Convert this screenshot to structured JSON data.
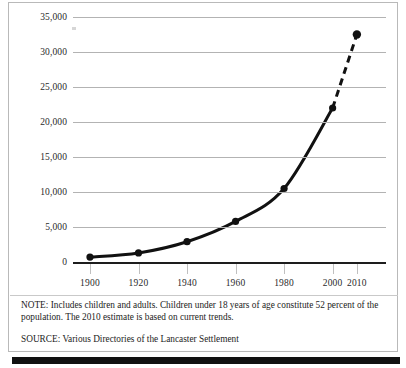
{
  "figure": {
    "note_label": "NOTE:",
    "note": "NOTE: Includes children and adults. Children under 18 years of age constitute 52 percent of the population. The 2010 estimate is based on current trends.",
    "source": "SOURCE: Various Directories of the Lancaster Settlement",
    "border_color": "#b9b9b9",
    "line_color": "#111111",
    "gridline_color": "#b3b3b3"
  },
  "chart_data": {
    "type": "line",
    "title": "",
    "subtitle": "",
    "xlabel": "",
    "ylabel": "",
    "x": [
      1900,
      1920,
      1940,
      1960,
      1980,
      2000,
      2010
    ],
    "values": [
      700,
      1300,
      2900,
      5800,
      10500,
      22000,
      32500
    ],
    "series": [
      {
        "name": "Lancaster Settlement population",
        "values": [
          700,
          1300,
          2900,
          5800,
          10500,
          22000,
          32500
        ]
      }
    ],
    "xtick_labels": [
      "1900",
      "1920",
      "1940",
      "1960",
      "1980",
      "2000",
      "2010"
    ],
    "ytick_labels": [
      "0",
      "5,000",
      "10,000",
      "15,000",
      "20,000",
      "25,000",
      "30,000",
      "35,000"
    ],
    "ytick_values": [
      0,
      5000,
      10000,
      15000,
      20000,
      25000,
      30000,
      35000
    ],
    "ylim": [
      0,
      35000
    ],
    "xlim": [
      1893,
      2022
    ],
    "grid": true,
    "legend": "none",
    "marker": "filled-circle",
    "estimate_segment": {
      "from_x": 2000,
      "to_x": 2010,
      "style": "dashed",
      "note": "2010 estimate is based on current trends"
    }
  }
}
